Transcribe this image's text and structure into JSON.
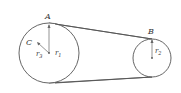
{
  "diagram": {
    "type": "belt-pulley",
    "labels": {
      "A": "A",
      "B": "B",
      "C": "C",
      "r1": "r",
      "r1_sub": "1",
      "r2": "r",
      "r2_sub": "2",
      "r3": "r",
      "r3_sub": "3"
    },
    "pulleys": [
      {
        "name": "large",
        "cx": 49,
        "cy": 53,
        "r": 30
      },
      {
        "name": "small",
        "cx": 152,
        "cy": 58,
        "r": 19
      }
    ],
    "colors": {
      "stroke": "#555555",
      "text": "#333333"
    }
  }
}
